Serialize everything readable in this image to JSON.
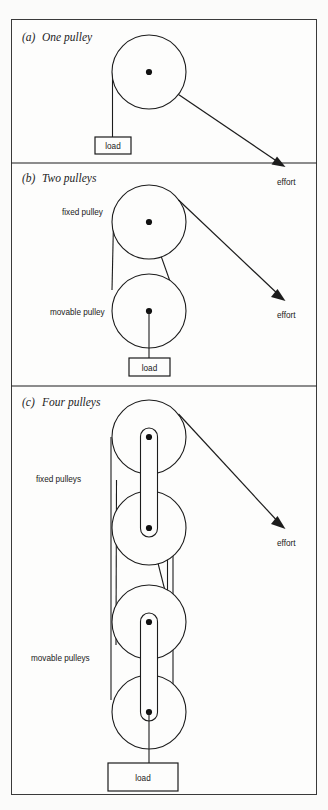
{
  "figure": {
    "background_color": "#fbfbfa",
    "border_color": "#3a3a3a",
    "ink_color": "#1c1c1c"
  },
  "sections": [
    {
      "id": "one-pulley",
      "enumerator": "(a)",
      "title": "One pulley",
      "pulley_count": 1,
      "labels": [],
      "load_label": "load",
      "effort_label": "effort"
    },
    {
      "id": "two-pulleys",
      "enumerator": "(b)",
      "title": "Two pulleys",
      "pulley_count": 2,
      "labels": [
        "fixed pulley",
        "movable pulley"
      ],
      "load_label": "load",
      "effort_label": "effort"
    },
    {
      "id": "four-pulleys",
      "enumerator": "(c)",
      "title": "Four pulleys",
      "pulley_count": 4,
      "labels": [
        "fixed pulleys",
        "movable pulleys"
      ],
      "load_label": "load",
      "effort_label": "effort"
    }
  ],
  "section_a": {
    "enumerator": "(a)",
    "title": "One pulley",
    "load": "load",
    "effort": "effort"
  },
  "section_b": {
    "enumerator": "(b)",
    "title": "Two pulleys",
    "fixed_pulley": "fixed pulley",
    "movable_pulley": "movable pulley",
    "load": "load",
    "effort": "effort"
  },
  "section_c": {
    "enumerator": "(c)",
    "title": "Four pulleys",
    "fixed_pulleys": "fixed pulleys",
    "movable_pulleys": "movable pulleys",
    "load": "load",
    "effort": "effort"
  }
}
